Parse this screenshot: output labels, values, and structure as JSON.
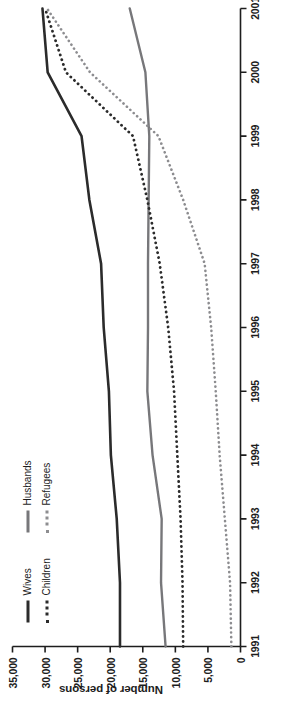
{
  "figure": {
    "orientation": "rotated-90-ccw",
    "background": "#ffffff",
    "y_axis_title": "Number of persons"
  },
  "legend": {
    "position": "upper-left-inside",
    "columns": [
      {
        "entries": [
          {
            "label": "Wives",
            "style": "solid",
            "color": "#2b2b2b",
            "icon": "line-solid-dark-icon"
          },
          {
            "label": "Children",
            "style": "dotted",
            "color": "#2b2b2b",
            "icon": "line-dotted-dark-icon"
          }
        ]
      },
      {
        "entries": [
          {
            "label": "Husbands",
            "style": "solid",
            "color": "#77777a",
            "icon": "line-solid-gray-icon"
          },
          {
            "label": "Refugees",
            "style": "dotted",
            "color": "#8d8d90",
            "icon": "line-dotted-gray-icon"
          }
        ]
      }
    ]
  },
  "chart_data": {
    "type": "line",
    "title": "",
    "subtitle": "",
    "xlabel": "",
    "ylabel": "Number of persons",
    "x": [
      1991,
      1992,
      1993,
      1994,
      1995,
      1996,
      1997,
      1998,
      1999,
      2000,
      2001
    ],
    "xtick_labels": [
      "1991",
      "1992",
      "1993",
      "1994",
      "1995",
      "1996",
      "1997",
      "1998",
      "1999",
      "2000",
      "2001"
    ],
    "xlim": [
      1991,
      2001
    ],
    "ylim": [
      0,
      35000
    ],
    "ytick_values": [
      0,
      5000,
      10000,
      15000,
      20000,
      25000,
      30000,
      35000
    ],
    "ytick_labels": [
      "0",
      "5,000",
      "10,000",
      "15,000",
      "20,000",
      "25,000",
      "30,000",
      "35,000"
    ],
    "grid": false,
    "legend_position": "upper left",
    "series": [
      {
        "name": "Wives",
        "style": "solid",
        "color": "#2b2b2b",
        "width": 2.6,
        "values": [
          18500,
          18500,
          19000,
          19900,
          20200,
          21000,
          21400,
          23200,
          24400,
          29600,
          30400
        ]
      },
      {
        "name": "Husbands",
        "style": "solid",
        "color": "#77777a",
        "width": 2.4,
        "values": [
          11500,
          12200,
          12100,
          13500,
          14300,
          14200,
          14200,
          14100,
          14000,
          14600,
          17000
        ]
      },
      {
        "name": "Children",
        "style": "dotted",
        "color": "#2b2b2b",
        "width": 2.8,
        "values": [
          8800,
          8900,
          9200,
          9700,
          10200,
          11100,
          12400,
          14300,
          16500,
          26800,
          30000
        ]
      },
      {
        "name": "Refugees",
        "style": "dotted",
        "color": "#8d8d90",
        "width": 2.6,
        "values": [
          1400,
          1600,
          2400,
          3200,
          3800,
          4500,
          5500,
          8800,
          12600,
          23100,
          29700
        ]
      }
    ]
  }
}
